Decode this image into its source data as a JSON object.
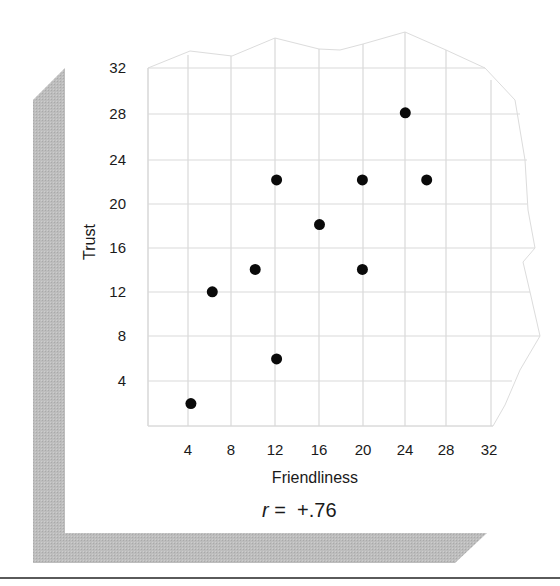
{
  "chart_data": {
    "type": "scatter",
    "title": "",
    "xlabel": "Friendliness",
    "ylabel": "Trust",
    "xlim": [
      0,
      32
    ],
    "ylim": [
      0,
      32
    ],
    "x_ticks": [
      4,
      8,
      12,
      16,
      20,
      24,
      28,
      32
    ],
    "y_ticks": [
      4,
      8,
      12,
      16,
      20,
      24,
      28,
      32
    ],
    "grid": true,
    "legend": null,
    "series": [
      {
        "name": "observations",
        "points": [
          {
            "x": 4,
            "y": 2
          },
          {
            "x": 6,
            "y": 12
          },
          {
            "x": 10,
            "y": 14
          },
          {
            "x": 12,
            "y": 22
          },
          {
            "x": 12,
            "y": 6
          },
          {
            "x": 16,
            "y": 18
          },
          {
            "x": 20,
            "y": 22
          },
          {
            "x": 20,
            "y": 14
          },
          {
            "x": 24,
            "y": 28
          },
          {
            "x": 26,
            "y": 22
          }
        ]
      }
    ],
    "annotations": [
      {
        "text_italic": "r",
        "text": " =  +.76"
      }
    ]
  },
  "labels": {
    "x_axis": "Friendliness",
    "y_axis": "Trust",
    "correlation_symbol": "r",
    "correlation_value": " =  +.76"
  },
  "colors": {
    "grid": "#d9d9d9",
    "point": "#0a0a0a",
    "frame_shadow": "#b5b5b5",
    "rule": "#5a5a5a"
  }
}
